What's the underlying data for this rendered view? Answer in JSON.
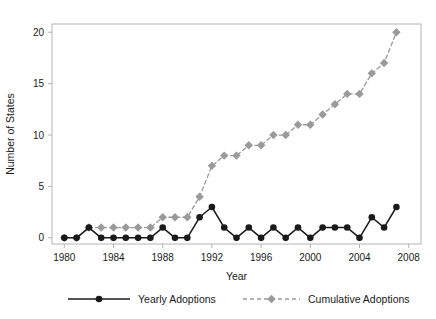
{
  "chart_data": {
    "type": "line",
    "title": "",
    "xlabel": "Year",
    "ylabel": "Number of States",
    "x": [
      1980,
      1981,
      1982,
      1983,
      1984,
      1985,
      1986,
      1987,
      1988,
      1989,
      1990,
      1991,
      1992,
      1993,
      1994,
      1995,
      1996,
      1997,
      1998,
      1999,
      2000,
      2001,
      2002,
      2003,
      2004,
      2005,
      2006,
      2007
    ],
    "series": [
      {
        "name": "Yearly Adoptions",
        "values": [
          0,
          0,
          1,
          0,
          0,
          0,
          0,
          0,
          1,
          0,
          0,
          2,
          3,
          1,
          0,
          1,
          0,
          1,
          0,
          1,
          0,
          1,
          1,
          1,
          0,
          2,
          1,
          3
        ],
        "color": "#1a1a1a",
        "marker": "circle",
        "linestyle": "solid"
      },
      {
        "name": "Cumulative Adoptions",
        "values": [
          0,
          0,
          1,
          1,
          1,
          1,
          1,
          1,
          2,
          2,
          2,
          4,
          7,
          8,
          8,
          9,
          9,
          10,
          10,
          11,
          11,
          12,
          13,
          14,
          14,
          16,
          17,
          20
        ],
        "color": "#9a9a9a",
        "marker": "diamond",
        "linestyle": "dashed"
      }
    ],
    "xlim": [
      1979,
      2009
    ],
    "ylim": [
      -0.6,
      20.8
    ],
    "xticks": [
      1980,
      1984,
      1988,
      1992,
      1996,
      2000,
      2004,
      2008
    ],
    "xticklabels": [
      "1980",
      "1984",
      "1988",
      "1992",
      "1996",
      "2000",
      "2004",
      "2008"
    ],
    "yticks": [
      0,
      5,
      10,
      15,
      20
    ],
    "yticklabels": [
      "0",
      "5",
      "10",
      "15",
      "20"
    ],
    "grid": false,
    "legend_position": "bottom",
    "frame_color": "#b4b4b4"
  },
  "legend": {
    "items": [
      {
        "label": "Yearly Adoptions"
      },
      {
        "label": "Cumulative Adoptions"
      }
    ]
  }
}
